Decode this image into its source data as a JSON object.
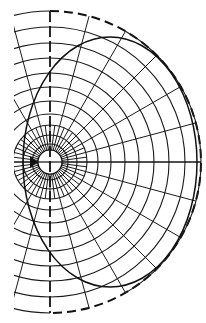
{
  "diagram": {
    "type": "polar-grid-with-ellipse",
    "title": "",
    "colors": {
      "line": "#1a1a1a",
      "background": "#ffffff"
    },
    "geometry": {
      "center": [
        50,
        162
      ],
      "ring_radii": [
        12,
        18,
        27,
        37,
        48,
        61,
        75,
        89,
        104,
        119,
        135,
        151
      ],
      "left_clip_x": 14,
      "inner_radial_step_deg": 7.5,
      "inner_radial_max_radius": 37,
      "outer_radial_step_deg": 15,
      "radial_angles_deg_outer": [
        -120,
        -105,
        -90,
        -75,
        -60,
        -45,
        -30,
        -15,
        0,
        15,
        30,
        45,
        60,
        75,
        90,
        105,
        120
      ],
      "outer_boundary": {
        "radius": 151,
        "style": "dashed on right half, solid at far right",
        "solid_from_deg": -60,
        "solid_to_deg": 60
      },
      "vertical_axis": {
        "x": 50,
        "style": "dashed"
      },
      "ellipse": {
        "cx": 110,
        "cy": 162,
        "rx": 87,
        "ry": 125,
        "style": "solid"
      }
    },
    "labels": []
  }
}
